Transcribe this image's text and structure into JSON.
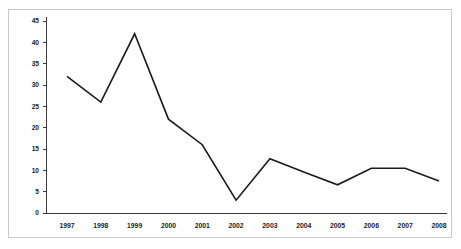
{
  "chart_data": {
    "type": "line",
    "title": "",
    "subtitle": "",
    "xlabel": "",
    "ylabel": "",
    "categories": [
      "1997",
      "1998",
      "1999",
      "2000",
      "2001",
      "2002",
      "2003",
      "2004",
      "2005",
      "2006",
      "2007",
      "2008"
    ],
    "values": [
      32,
      26,
      42,
      22,
      16,
      3,
      12.7,
      9.6,
      6.6,
      10.5,
      10.5,
      7.5
    ],
    "series": [
      {
        "name": "",
        "values": [
          32,
          26,
          42,
          22,
          16,
          3,
          12.7,
          9.6,
          6.6,
          10.5,
          10.5,
          7.5
        ]
      }
    ],
    "x_tick_labels": [
      "1997",
      "1998",
      "1999",
      "2000",
      "2001",
      "2002",
      "2003",
      "2004",
      "2005",
      "2006",
      "2007",
      "2008"
    ],
    "y_tick_labels": [
      "0",
      "5",
      "10",
      "15",
      "20",
      "25",
      "30",
      "35",
      "40",
      "45"
    ],
    "y_ticks": [
      0,
      5,
      10,
      15,
      20,
      25,
      30,
      35,
      40,
      45
    ],
    "ylim": [
      0,
      45
    ],
    "grid": false,
    "legend": null,
    "legend_position": "none",
    "annotations": [],
    "line_color": "#1a1a1a",
    "axis_color": "#3a3a3a",
    "frame_color": "#c9c9c9",
    "background_color": "#ffffff"
  }
}
